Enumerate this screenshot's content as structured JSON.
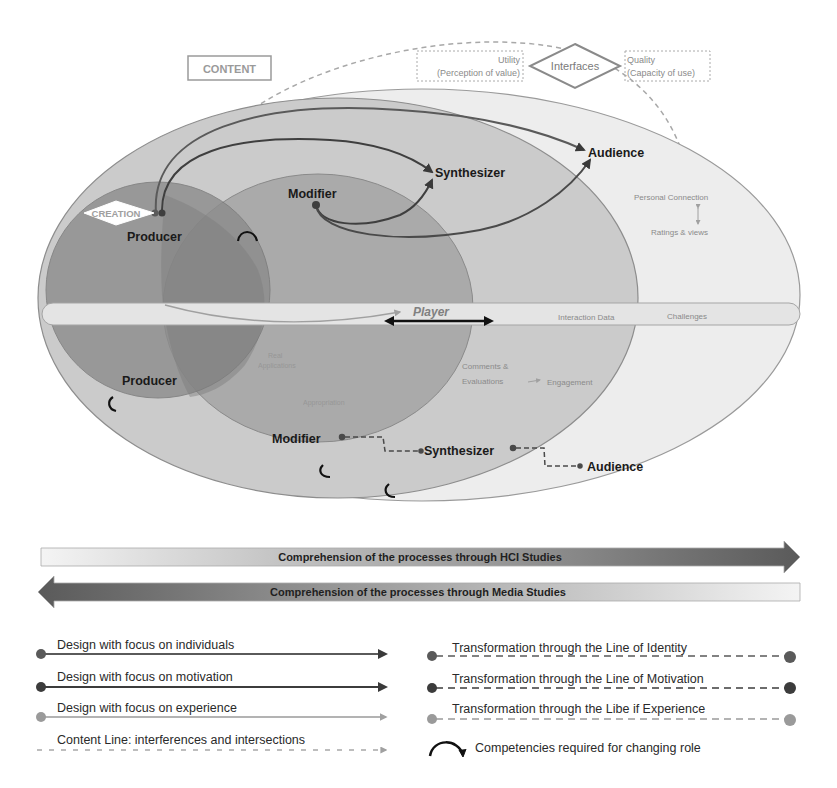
{
  "diagram": {
    "top": {
      "content_box": "CONTENT",
      "interfaces_diamond": "Interfaces",
      "utility_line1": "Utility",
      "utility_line2": "(Perception of value)",
      "quality_line1": "Quality",
      "quality_line2": "(Capacity of use)"
    },
    "upper_roles": {
      "creation_diamond": "CREATION",
      "producer": "Producer",
      "modifier": "Modifier",
      "synthesizer": "Synthesizer",
      "audience": "Audience"
    },
    "band": {
      "player": "Player",
      "interaction_data": "Interaction Data",
      "challenges": "Challenges"
    },
    "right_annotations": {
      "personal_connection": "Personal Connection",
      "ratings_views": "Ratings & views"
    },
    "lower_annotations": {
      "real_line1": "Real",
      "real_line2": "Applications",
      "appropriation": "Appropriation",
      "comments_line1": "Comments &",
      "comments_line2": "Evaluations",
      "engagement": "Engagement"
    },
    "lower_roles": {
      "producer": "Producer",
      "modifier": "Modifier",
      "synthesizer": "Synthesizer",
      "audience": "Audience"
    },
    "colors": {
      "outer_ellipse": "#ebebeb",
      "audience_ellipse": "#c9c9c9",
      "synth_ellipse": "#a9a9a9",
      "modifier_ellipse": "#9a9a9a",
      "producer_ellipse": "#8a8a8a",
      "band": "#e6e6e6",
      "individuals_line": "#5a5a5a",
      "motivation_line": "#3f3f3f",
      "experience_line": "#9a9a9a"
    }
  },
  "arrows": {
    "hci": "Comprehension of the processes through HCI Studies",
    "media": "Comprehension of the processes through Media Studies"
  },
  "legend": {
    "left": [
      {
        "label": "Design with focus on individuals",
        "style": "solid-individuals"
      },
      {
        "label": "Design with focus on motivation",
        "style": "solid-motivation"
      },
      {
        "label": "Design with focus on experience",
        "style": "solid-experience"
      },
      {
        "label": "Content Line: interferences and intersections",
        "style": "dotted-content"
      }
    ],
    "right": [
      {
        "label": "Transformation through the Line of Identity",
        "style": "dashed-identity"
      },
      {
        "label": "Transformation through the Line of Motivation",
        "style": "dashed-motivation"
      },
      {
        "label": "Transformation through the Libe if Experience",
        "style": "dashed-experience"
      },
      {
        "label": "Competencies required for changing role",
        "style": "curved-arrow"
      }
    ]
  }
}
